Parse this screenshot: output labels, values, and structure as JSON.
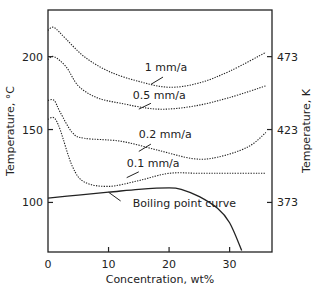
{
  "chart_data": {
    "type": "line",
    "title": "",
    "xlabel": "Concentration, wt%",
    "ylabel": "Temperature, °C",
    "y2label": "Temperature, K",
    "xlim": [
      0,
      37
    ],
    "ylim": [
      66,
      232
    ],
    "grid": false,
    "legend": "inline labels",
    "x_ticks": [
      0,
      10,
      20,
      30
    ],
    "y_ticks": [
      100,
      150,
      200
    ],
    "y2_ticks": [
      {
        "label": "373",
        "celsius": 100
      },
      {
        "label": "423",
        "celsius": 150
      },
      {
        "label": "473",
        "celsius": 200
      }
    ],
    "series": [
      {
        "name": "1 mm/a",
        "style": "dotted",
        "points": [
          [
            0,
            218
          ],
          [
            1,
            220
          ],
          [
            3,
            212
          ],
          [
            6,
            200
          ],
          [
            10,
            190
          ],
          [
            15,
            183
          ],
          [
            20,
            179
          ],
          [
            25,
            182
          ],
          [
            30,
            190
          ],
          [
            36,
            203
          ]
        ],
        "label_pos": [
          16,
          190
        ],
        "leader": [
          [
            19,
            186
          ],
          [
            17,
            181
          ]
        ]
      },
      {
        "name": "0.5 mm/a",
        "style": "dotted",
        "points": [
          [
            0,
            198
          ],
          [
            1,
            200
          ],
          [
            3,
            193
          ],
          [
            5,
            180
          ],
          [
            8,
            172
          ],
          [
            12,
            168
          ],
          [
            18,
            164
          ],
          [
            24,
            166
          ],
          [
            30,
            172
          ],
          [
            36,
            180
          ]
        ],
        "label_pos": [
          14,
          171
        ],
        "leader": [
          [
            17,
            168
          ],
          [
            15,
            164
          ]
        ]
      },
      {
        "name": "0.2 mm/a",
        "style": "dotted",
        "points": [
          [
            0,
            170
          ],
          [
            1,
            170
          ],
          [
            2,
            162
          ],
          [
            4,
            148
          ],
          [
            6,
            144
          ],
          [
            12,
            142
          ],
          [
            18,
            136
          ],
          [
            24,
            130
          ],
          [
            28,
            131
          ],
          [
            33,
            138
          ],
          [
            36,
            148
          ]
        ],
        "label_pos": [
          15,
          144
        ],
        "leader": [
          [
            17,
            140
          ],
          [
            15,
            135
          ]
        ]
      },
      {
        "name": "0.1 mm/a",
        "style": "dotted",
        "points": [
          [
            0,
            157
          ],
          [
            1,
            158
          ],
          [
            2,
            150
          ],
          [
            4,
            125
          ],
          [
            6,
            114
          ],
          [
            10,
            111
          ],
          [
            15,
            115
          ],
          [
            20,
            120
          ],
          [
            25,
            120
          ],
          [
            30,
            120
          ],
          [
            36,
            120
          ]
        ],
        "label_pos": [
          13,
          124
        ],
        "leader": [
          [
            15,
            121
          ],
          [
            13,
            117
          ]
        ]
      },
      {
        "name": "Boiling point curve",
        "style": "solid",
        "points": [
          [
            0,
            103
          ],
          [
            5,
            105
          ],
          [
            10,
            107
          ],
          [
            15,
            109
          ],
          [
            20,
            110
          ],
          [
            22,
            109
          ],
          [
            25,
            104
          ],
          [
            28,
            96
          ],
          [
            30,
            86
          ],
          [
            32,
            67
          ]
        ],
        "label_pos": [
          14,
          97
        ],
        "leader": [
          [
            12,
            101
          ],
          [
            10,
            107
          ]
        ]
      }
    ]
  }
}
